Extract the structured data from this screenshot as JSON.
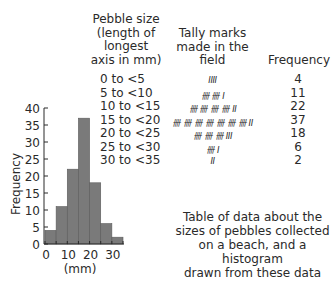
{
  "table": {
    "headers": {
      "size": [
        "Pebble size",
        "(length of",
        "longest",
        "axis in mm)"
      ],
      "tally": [
        "Tally marks",
        "made in the",
        "field"
      ],
      "frequency": "Frequency"
    },
    "rows": [
      {
        "size": "0 to <5",
        "tally": "IIII",
        "frequency": "4"
      },
      {
        "size": "5 to <10",
        "tally": "卌 卌 I",
        "frequency": "11"
      },
      {
        "size": "10 to <15",
        "tally": "卌 卌 卌 卌 II",
        "frequency": "22"
      },
      {
        "size": "15 to <20",
        "tally": "卌 卌 卌 卌 卌 卌 卌 II",
        "frequency": "37"
      },
      {
        "size": "20 to <25",
        "tally": "卌 卌 卌 III",
        "frequency": "18"
      },
      {
        "size": "25 to <30",
        "tally": "卌 I",
        "frequency": "6"
      },
      {
        "size": "30 to <35",
        "tally": "II",
        "frequency": "2"
      }
    ]
  },
  "caption": [
    "Table of data about the",
    "sizes of pebbles collected",
    "on a beach, and a histogram",
    "drawn from these data"
  ],
  "chart_data": {
    "type": "bar",
    "subtype": "histogram",
    "categories": [
      "0 to <5",
      "5 to <10",
      "10 to <15",
      "15 to <20",
      "20 to <25",
      "25 to <30",
      "30 to <35"
    ],
    "bin_edges": [
      0,
      5,
      10,
      15,
      20,
      25,
      30,
      35
    ],
    "values": [
      4,
      11,
      22,
      37,
      18,
      6,
      2
    ],
    "title": "",
    "xlabel": "(mm)",
    "ylabel": "Frequency",
    "xticks": [
      "0",
      "10",
      "20",
      "30"
    ],
    "yticks": [
      "0",
      "5",
      "10",
      "15",
      "20",
      "25",
      "30",
      "35",
      "40"
    ],
    "xlim": [
      0,
      35
    ],
    "ylim": [
      0,
      40
    ],
    "grid": false,
    "legend": null,
    "bar_color": "#7a7a7a"
  }
}
